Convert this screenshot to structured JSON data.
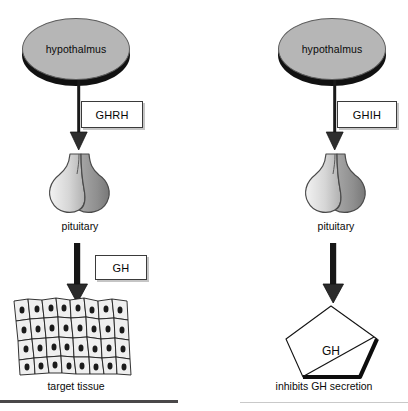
{
  "diagram": {
    "panels": [
      {
        "id": "stimulation",
        "side": "left",
        "source_label": "hypothalmus",
        "hormone_label": "GHRH",
        "gland_label": "pituitary",
        "output_label": "GH",
        "effector_label": "target tissue",
        "effector_icon": "target-tissue-icon"
      },
      {
        "id": "inhibition",
        "side": "right",
        "source_label": "hypothalmus",
        "hormone_label": "GHIH",
        "gland_label": "pituitary",
        "output_label": "GH",
        "effector_label": "inhibits GH secretion",
        "effector_icon": "crossed-out-gh-pentagon-icon"
      }
    ],
    "colors": {
      "ellipse_fill": "#b6b6b6",
      "ellipse_shadow": "#111111",
      "arrow": "#1a1a1a",
      "box_border": "#3a3a3a",
      "gland_light": "#e2e2e2",
      "gland_dark": "#8e8e8e",
      "rule_left": "#4a4849",
      "rule_right": "#c9c9c9",
      "background": "#ffffff"
    }
  }
}
